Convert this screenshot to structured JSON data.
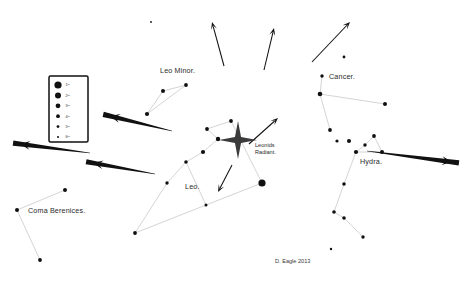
{
  "chart_data": {
    "type": "scatter",
    "xlabel": "",
    "ylabel": "",
    "xlim": [
      0,
      469
    ],
    "ylim": [
      0,
      286
    ],
    "grid": false,
    "legend_position": "left",
    "credit": "D. Eagle 2013",
    "annotations": [
      {
        "name": "leo-minor",
        "text": "Leo Minor.",
        "x": 160,
        "y": 73
      },
      {
        "name": "cancer",
        "text": "Cancer.",
        "x": 329,
        "y": 79
      },
      {
        "name": "hydra",
        "text": "Hydra.",
        "x": 360,
        "y": 164
      },
      {
        "name": "leo",
        "text": "Leo.",
        "x": 185,
        "y": 189
      },
      {
        "name": "coma-berenices",
        "text": "Coma Berenices.",
        "x": 28,
        "y": 213
      },
      {
        "name": "leonids-radiant-line1",
        "text": "Leonids",
        "x": 255,
        "y": 147
      },
      {
        "name": "leonids-radiant-line2",
        "text": "Radiant.",
        "x": 255,
        "y": 154
      }
    ],
    "legend": {
      "title": "",
      "entries": [
        {
          "label": "1ᵗʰ",
          "magnitude": 1,
          "radius": 3.6
        },
        {
          "label": "2ᵗʰ",
          "magnitude": 2,
          "radius": 3.0
        },
        {
          "label": "3ʳᵈ",
          "magnitude": 3,
          "radius": 2.4
        },
        {
          "label": "4ᵗʰ",
          "magnitude": 4,
          "radius": 1.9
        },
        {
          "label": "5ᵗʰ",
          "magnitude": 5,
          "radius": 1.4
        },
        {
          "label": "6ᵗʰ",
          "magnitude": 6,
          "radius": 1.0
        }
      ]
    },
    "series": [
      {
        "name": "Leo",
        "stars": [
          {
            "x": 262,
            "y": 183,
            "r": 3.6
          },
          {
            "x": 218,
            "y": 139,
            "r": 2.2
          },
          {
            "x": 231,
            "y": 121,
            "r": 1.9
          },
          {
            "x": 207,
            "y": 129,
            "r": 1.9
          },
          {
            "x": 203,
            "y": 152,
            "r": 2.1
          },
          {
            "x": 186,
            "y": 162,
            "r": 1.8
          },
          {
            "x": 167,
            "y": 183,
            "r": 1.7
          },
          {
            "x": 135,
            "y": 233,
            "r": 1.9
          },
          {
            "x": 206,
            "y": 205,
            "r": 1.5
          }
        ],
        "lines": [
          [
            [
              231,
              121
            ],
            [
              207,
              129
            ]
          ],
          [
            [
              207,
              129
            ],
            [
              218,
              139
            ]
          ],
          [
            [
              218,
              139
            ],
            [
              203,
              152
            ]
          ],
          [
            [
              203,
              152
            ],
            [
              186,
              162
            ]
          ],
          [
            [
              186,
              162
            ],
            [
              167,
              183
            ]
          ],
          [
            [
              167,
              183
            ],
            [
              135,
              233
            ]
          ],
          [
            [
              135,
              233
            ],
            [
              206,
              205
            ]
          ],
          [
            [
              206,
              205
            ],
            [
              262,
              183
            ]
          ],
          [
            [
              262,
              183
            ],
            [
              231,
              121
            ]
          ],
          [
            [
              186,
              162
            ],
            [
              206,
              205
            ]
          ]
        ]
      },
      {
        "name": "Leo Minor",
        "stars": [
          {
            "x": 186,
            "y": 85,
            "r": 1.9
          },
          {
            "x": 163,
            "y": 91,
            "r": 2.0
          },
          {
            "x": 147,
            "y": 114,
            "r": 2.1
          }
        ],
        "lines": [
          [
            [
              186,
              85
            ],
            [
              163,
              91
            ]
          ],
          [
            [
              163,
              91
            ],
            [
              147,
              114
            ]
          ],
          [
            [
              147,
              114
            ],
            [
              186,
              85
            ]
          ]
        ]
      },
      {
        "name": "Cancer",
        "stars": [
          {
            "x": 322,
            "y": 76,
            "r": 1.7
          },
          {
            "x": 320,
            "y": 94,
            "r": 2.3
          },
          {
            "x": 385,
            "y": 104,
            "r": 2.0
          },
          {
            "x": 330,
            "y": 130,
            "r": 1.9
          }
        ],
        "lines": [
          [
            [
              322,
              76
            ],
            [
              320,
              94
            ]
          ],
          [
            [
              320,
              94
            ],
            [
              385,
              104
            ]
          ],
          [
            [
              320,
              94
            ],
            [
              330,
              130
            ]
          ]
        ]
      },
      {
        "name": "Hydra",
        "stars": [
          {
            "x": 349,
            "y": 141,
            "r": 2.0
          },
          {
            "x": 374,
            "y": 136,
            "r": 1.9
          },
          {
            "x": 365,
            "y": 145,
            "r": 1.7
          },
          {
            "x": 382,
            "y": 152,
            "r": 2.0
          },
          {
            "x": 356,
            "y": 152,
            "r": 2.1
          },
          {
            "x": 344,
            "y": 184,
            "r": 1.8
          },
          {
            "x": 334,
            "y": 212,
            "r": 1.8
          },
          {
            "x": 344,
            "y": 218,
            "r": 1.8
          },
          {
            "x": 363,
            "y": 237,
            "r": 1.7
          }
        ],
        "lines": [
          [
            [
              365,
              145
            ],
            [
              374,
              136
            ]
          ],
          [
            [
              374,
              136
            ],
            [
              382,
              152
            ]
          ],
          [
            [
              382,
              152
            ],
            [
              356,
              152
            ]
          ],
          [
            [
              356,
              152
            ],
            [
              365,
              145
            ]
          ],
          [
            [
              356,
              152
            ],
            [
              344,
              184
            ]
          ],
          [
            [
              344,
              184
            ],
            [
              334,
              212
            ]
          ],
          [
            [
              334,
              212
            ],
            [
              344,
              218
            ]
          ],
          [
            [
              344,
              218
            ],
            [
              363,
              237
            ]
          ]
        ]
      },
      {
        "name": "Coma Berenices",
        "stars": [
          {
            "x": 65,
            "y": 190,
            "r": 2.0
          },
          {
            "x": 17,
            "y": 210,
            "r": 2.0
          },
          {
            "x": 40,
            "y": 260,
            "r": 1.9
          }
        ],
        "lines": [
          [
            [
              65,
              190
            ],
            [
              17,
              210
            ]
          ],
          [
            [
              17,
              210
            ],
            [
              40,
              260
            ]
          ]
        ]
      },
      {
        "name": "Field Stars",
        "stars": [
          {
            "x": 344,
            "y": 57,
            "r": 1.4
          },
          {
            "x": 337,
            "y": 141,
            "r": 1.6
          },
          {
            "x": 151,
            "y": 22,
            "r": 0.9
          },
          {
            "x": 331,
            "y": 249,
            "r": 1.2
          }
        ],
        "lines": []
      }
    ],
    "meteor_trails": [
      {
        "name": "trail-up-left",
        "style": "thin",
        "x1": 224,
        "y1": 66,
        "x2": 212,
        "y2": 22
      },
      {
        "name": "trail-up-center",
        "style": "thin",
        "x1": 264,
        "y1": 70,
        "x2": 274,
        "y2": 28
      },
      {
        "name": "trail-up-right",
        "style": "thin",
        "x1": 312,
        "y1": 62,
        "x2": 350,
        "y2": 22
      },
      {
        "name": "trail-radiant-ne",
        "style": "thin",
        "x1": 249,
        "y1": 144,
        "x2": 278,
        "y2": 118
      },
      {
        "name": "trail-radiant-sw",
        "style": "thin",
        "x1": 232,
        "y1": 165,
        "x2": 218,
        "y2": 192
      },
      {
        "name": "trail-west-upper",
        "style": "thick",
        "x1": 172,
        "y1": 131,
        "x2": 110,
        "y2": 116
      },
      {
        "name": "trail-west-lower",
        "style": "thick",
        "x1": 155,
        "y1": 174,
        "x2": 93,
        "y2": 163
      },
      {
        "name": "trail-far-west",
        "style": "thick",
        "x1": 90,
        "y1": 153,
        "x2": 20,
        "y2": 144
      },
      {
        "name": "trail-east",
        "style": "thick",
        "x1": 367,
        "y1": 151,
        "x2": 452,
        "y2": 162
      }
    ],
    "radiant": {
      "name": "Leonids Radiant",
      "x": 238,
      "y": 140,
      "size": 19
    }
  }
}
